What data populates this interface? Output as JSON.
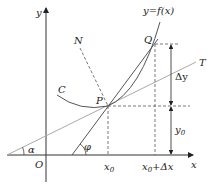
{
  "diagram": {
    "type": "derivative-geometric-meaning",
    "labels": {
      "y_axis": "y",
      "x_axis": "x",
      "origin": "O",
      "function": "y=f(x)",
      "curve": "C",
      "normal": "N",
      "tangent": "T",
      "point_p": "P",
      "point_q": "Q",
      "angle_alpha": "α",
      "angle_phi": "φ",
      "x0": "x",
      "x0_sub": "0",
      "x0_dx": "x",
      "x0_dx_sub": "0",
      "x0_dx_rest": "+Δx",
      "delta_y": "Δy",
      "y0": "y",
      "y0_sub": "0"
    },
    "colors": {
      "axis": "#333333",
      "curve": "#555555",
      "tangent": "#aaaaaa",
      "dashed": "#555555"
    }
  }
}
